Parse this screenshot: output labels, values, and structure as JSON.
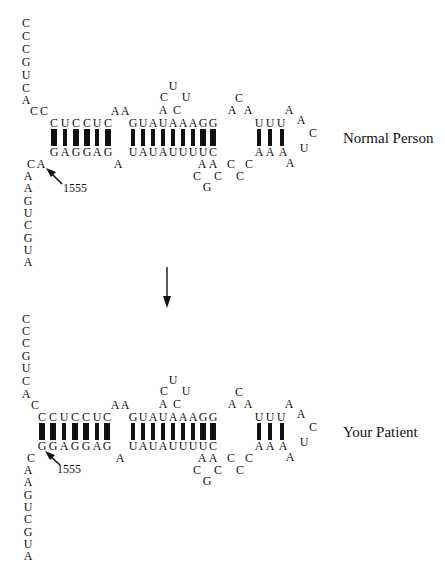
{
  "figure": {
    "type": "rRNA secondary structure comparison",
    "transition_arrow": "down-arrow"
  },
  "normal": {
    "label": "Normal Person",
    "mutation_position": "1555",
    "five_prime_tail": [
      "C",
      "C",
      "C",
      "G",
      "U",
      "C",
      "A"
    ],
    "cc_link": [
      "C",
      "C"
    ],
    "stem1_top": [
      "C",
      "U",
      "C",
      "C",
      "U",
      "C"
    ],
    "stem1_bottom": [
      "G",
      "A",
      "G",
      "G",
      "A",
      "G"
    ],
    "stem1_pairs": [
      3,
      2,
      3,
      3,
      2,
      3
    ],
    "bulge_top": [
      "A",
      "A"
    ],
    "stem2_top": [
      "G",
      "U",
      "A",
      "U",
      "A",
      "A",
      "A",
      "G",
      "G"
    ],
    "stem2_bottom": [
      "U",
      "A",
      "U",
      "A",
      "U",
      "U",
      "U",
      "U",
      "C"
    ],
    "stem2_pairs": [
      2,
      2,
      2,
      2,
      2,
      2,
      2,
      3,
      3
    ],
    "bulge_bottom": [
      "A"
    ],
    "hairpin1": [
      "A",
      "C",
      "U",
      "U",
      "C",
      "A"
    ],
    "loop_top": [
      "C",
      "A",
      "A"
    ],
    "stem3_top": [
      "U",
      "U",
      "U"
    ],
    "stem3_bottom": [
      "A",
      "A",
      "A"
    ],
    "stem3_pairs": [
      2,
      2,
      2
    ],
    "hairpin2": [
      "A",
      "A",
      "C",
      "U",
      "A"
    ],
    "loop_bottom": [
      "A",
      "A",
      "C",
      "C",
      "G",
      "C",
      "C",
      "C"
    ],
    "ca_link": [
      "C",
      "A"
    ],
    "three_prime_tail": [
      "A",
      "A",
      "G",
      "U",
      "C",
      "G",
      "U",
      "A"
    ]
  },
  "patient": {
    "label": "Your Patient",
    "mutation_position": "1555",
    "five_prime_tail": [
      "C",
      "C",
      "C",
      "G",
      "U",
      "C",
      "A"
    ],
    "c_link": [
      "C"
    ],
    "stem1_top": [
      "C",
      "C",
      "U",
      "C",
      "C",
      "U",
      "C"
    ],
    "stem1_bottom": [
      "G",
      "G",
      "A",
      "G",
      "G",
      "A",
      "G"
    ],
    "stem1_pairs": [
      3,
      3,
      2,
      3,
      3,
      2,
      3
    ],
    "bulge_top": [
      "A",
      "A"
    ],
    "stem2_top": [
      "G",
      "U",
      "A",
      "U",
      "A",
      "A",
      "A",
      "G",
      "G"
    ],
    "stem2_bottom": [
      "U",
      "A",
      "U",
      "A",
      "U",
      "U",
      "U",
      "U",
      "C"
    ],
    "stem2_pairs": [
      2,
      2,
      2,
      2,
      2,
      2,
      2,
      3,
      3
    ],
    "bulge_bottom": [
      "A"
    ],
    "hairpin1": [
      "A",
      "C",
      "U",
      "U",
      "C",
      "A"
    ],
    "loop_top": [
      "C",
      "A",
      "A"
    ],
    "stem3_top": [
      "U",
      "U",
      "U"
    ],
    "stem3_bottom": [
      "A",
      "A",
      "A"
    ],
    "stem3_pairs": [
      2,
      2,
      2
    ],
    "hairpin2": [
      "A",
      "A",
      "C",
      "U",
      "A"
    ],
    "loop_bottom": [
      "A",
      "A",
      "C",
      "C",
      "G",
      "C",
      "C",
      "C"
    ],
    "c_link_bottom": [
      "C"
    ],
    "three_prime_tail": [
      "A",
      "A",
      "G",
      "U",
      "C",
      "G",
      "U",
      "A"
    ]
  }
}
